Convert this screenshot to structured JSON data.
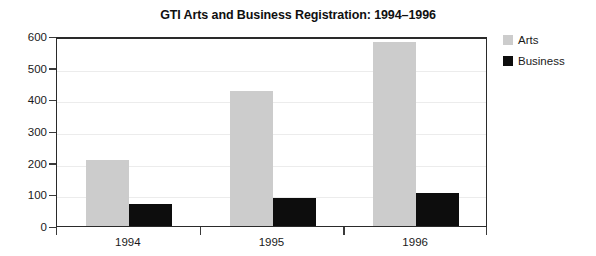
{
  "chart_data": {
    "type": "bar",
    "title": "GTI Arts and Business Registration: 1994–1996",
    "xlabel": "",
    "ylabel": "",
    "categories": [
      "1994",
      "1995",
      "1996"
    ],
    "series": [
      {
        "name": "Arts",
        "values": [
          210,
          425,
          580
        ],
        "color": "#cccccc"
      },
      {
        "name": "Business",
        "values": [
          68,
          90,
          105
        ],
        "color": "#0d0d0d"
      }
    ],
    "ylim": [
      0,
      600
    ],
    "yticks": [
      0,
      100,
      200,
      300,
      400,
      500,
      600
    ],
    "ytick_labels": [
      "0",
      "100",
      "200",
      "300",
      "400",
      "500",
      "600"
    ],
    "grid": true,
    "legend_position": "right",
    "legend": [
      {
        "label": "Arts",
        "swatch": "#cccccc"
      },
      {
        "label": "Business",
        "swatch": "#0d0d0d"
      }
    ]
  }
}
